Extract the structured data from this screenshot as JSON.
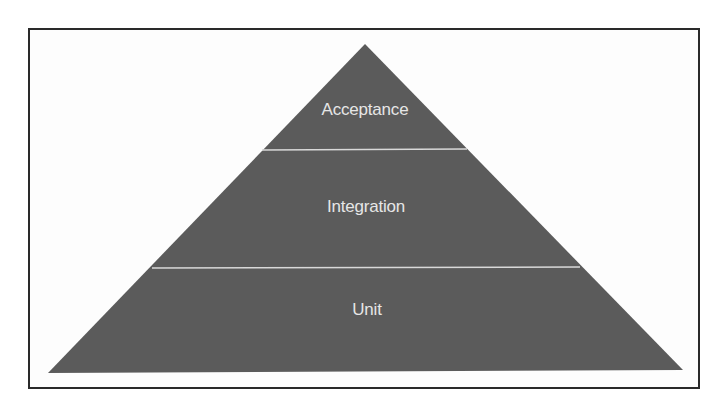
{
  "diagram": {
    "type": "pyramid",
    "fill_color": "#5b5b5b",
    "divider_color": "#d9d9d9",
    "text_color": "#e6e6e6",
    "levels": [
      {
        "label": "Acceptance"
      },
      {
        "label": "Integration"
      },
      {
        "label": "Unit"
      }
    ]
  }
}
